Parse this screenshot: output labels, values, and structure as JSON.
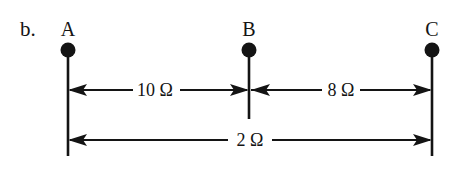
{
  "figure": {
    "item_label": "b.",
    "background_color": "#ffffff",
    "ink_color": "#141414",
    "nodes": [
      {
        "id": "A",
        "label": "A",
        "x": 68,
        "dot_y": 50,
        "line_bottom": 156
      },
      {
        "id": "B",
        "label": "B",
        "x": 249,
        "dot_y": 50,
        "line_bottom": 119
      },
      {
        "id": "C",
        "label": "C",
        "x": 432,
        "dot_y": 50,
        "line_bottom": 156
      }
    ],
    "dimensions": [
      {
        "id": "a-to-b",
        "label": "10 Ω",
        "value": 10,
        "unit": "Ω",
        "from": "A",
        "to": "B",
        "y": 90,
        "label_x": 155,
        "arrows": "both"
      },
      {
        "id": "b-to-c",
        "label": "8 Ω",
        "value": 8,
        "unit": "Ω",
        "from": "B",
        "to": "C",
        "y": 90,
        "label_x": 340,
        "arrows": "both"
      },
      {
        "id": "a-to-c",
        "label": "2 Ω",
        "value": 2,
        "unit": "Ω",
        "from": "A",
        "to": "C",
        "y": 140,
        "label_x": 250,
        "arrows": "both"
      }
    ]
  }
}
